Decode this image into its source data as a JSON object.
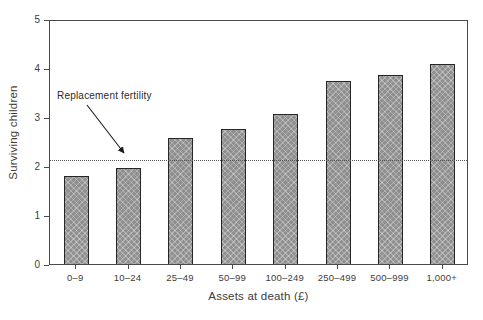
{
  "chart_data": {
    "type": "bar",
    "title": "",
    "xlabel": "Assets at death (£)",
    "ylabel": "Surviving children",
    "categories": [
      "0–9",
      "10–24",
      "25–49",
      "50–99",
      "100–249",
      "250–499",
      "500–999",
      "1,000+"
    ],
    "values": [
      1.84,
      2.0,
      2.61,
      2.79,
      3.1,
      3.77,
      3.9,
      4.12
    ],
    "ylim": [
      0,
      5
    ],
    "yticks": [
      0,
      1,
      2,
      3,
      4,
      5
    ],
    "ytick_labels": [
      "0",
      "1",
      "2",
      "3",
      "4",
      "5"
    ],
    "grid": false,
    "legend": "none",
    "bar_color": "#8f8f8f",
    "bar_edge_color": "#262626",
    "annotations": [
      {
        "label": "Replacement fertility",
        "value": 2.17,
        "line_style": "dotted",
        "line_color": "#555555"
      }
    ]
  }
}
